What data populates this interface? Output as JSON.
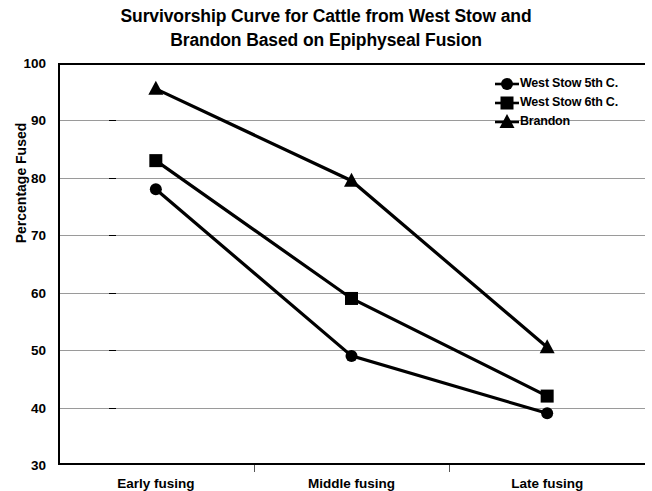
{
  "chart_data": {
    "type": "line",
    "title": "Survivorship Curve for Cattle from West Stow and Brandon Based on Epiphyseal Fusion",
    "title_lines": [
      "Survivorship Curve for Cattle from West Stow and",
      "Brandon Based on Epiphyseal Fusion"
    ],
    "xlabel": "",
    "ylabel": "Percentage Fused",
    "categories": [
      "Early fusing",
      "Middle fusing",
      "Late fusing"
    ],
    "ylim": [
      30,
      100
    ],
    "yticks": [
      30,
      40,
      50,
      60,
      70,
      80,
      90,
      100
    ],
    "ytick_labels": [
      "30",
      "40",
      "50",
      "60",
      "70",
      "80",
      "90",
      "100"
    ],
    "grid": true,
    "legend_position": "top-right",
    "series": [
      {
        "name": "West Stow 5th C.",
        "marker": "circle",
        "color": "#000000",
        "values": [
          78,
          49,
          39
        ]
      },
      {
        "name": "West Stow 6th C.",
        "marker": "square",
        "color": "#000000",
        "values": [
          83,
          59,
          42
        ]
      },
      {
        "name": "Brandon",
        "marker": "triangle",
        "color": "#000000",
        "values": [
          95.5,
          79.5,
          50.5
        ]
      }
    ]
  }
}
